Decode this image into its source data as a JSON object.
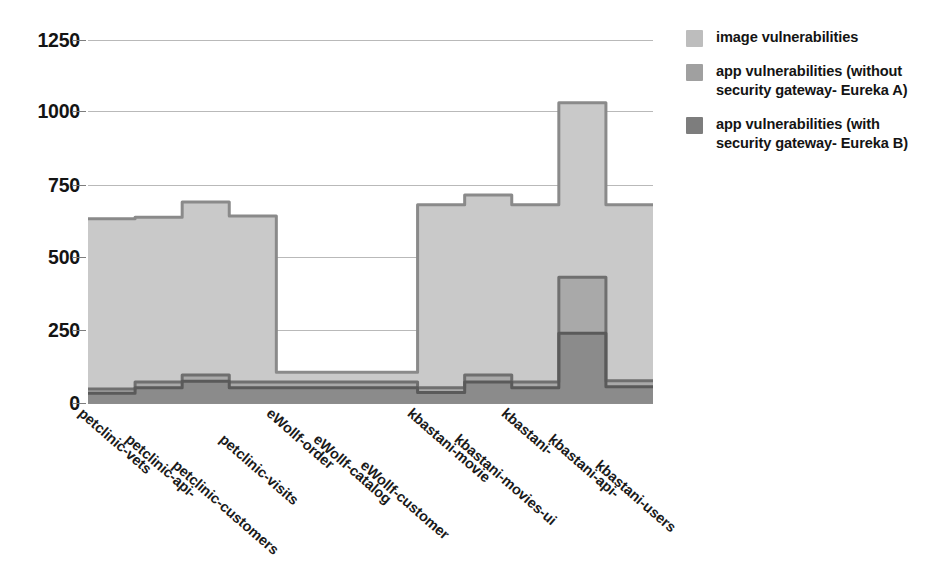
{
  "chart_data": {
    "type": "area",
    "title": "",
    "xlabel": "",
    "ylabel": "",
    "ylim": [
      0,
      1300
    ],
    "yticks": [
      0,
      250,
      500,
      750,
      1000,
      1250
    ],
    "ytick_labels": [
      "0",
      "250",
      "500",
      "750",
      "1000",
      "1250"
    ],
    "grid": true,
    "legend_position": "right",
    "step_style": "mid",
    "categories": [
      "petclinic-vets",
      "petclinic-api-",
      "petclinic-customers",
      "petclinic-visits",
      "eWollf-order",
      "eWollf-catalog",
      "eWollf-customer",
      "kbastani-movie",
      "kbastani-movies-ui",
      "kbastani-",
      "kbastani-api-",
      "kbastani-users"
    ],
    "series": [
      {
        "name": "image vulnerabilities",
        "color": "#c9c9c9",
        "edge_color": "#8a8a8a",
        "values": [
          660,
          665,
          720,
          670,
          110,
          110,
          110,
          710,
          745,
          710,
          1075,
          710
        ]
      },
      {
        "name": "app vulnerabilities (without security gateway- Eureka A)",
        "color": "#a9a9a9",
        "edge_color": "#6f6f6f",
        "values": [
          50,
          75,
          100,
          75,
          75,
          75,
          75,
          55,
          100,
          75,
          450,
          80
        ]
      },
      {
        "name": "app vulnerabilities (with security gateway- Eureka B)",
        "color": "#8b8b8b",
        "edge_color": "#5a5a5a",
        "values": [
          35,
          55,
          78,
          55,
          55,
          55,
          55,
          38,
          75,
          55,
          250,
          58
        ]
      }
    ]
  },
  "legend": {
    "items": [
      {
        "label": "image vulnerabilities",
        "color": "#bdbdbd"
      },
      {
        "label": "app vulnerabilities (without security gateway- Eureka A)",
        "color": "#a0a0a0"
      },
      {
        "label": "app vulnerabilities (with security gateway- Eureka B)",
        "color": "#7d7d7d"
      }
    ]
  },
  "axes": {
    "y_tick_labels": [
      "1250",
      "1000",
      "750",
      "500",
      "250",
      "0"
    ],
    "x_tick_labels": [
      "petclinic-vets",
      "petclinic-api-",
      "petclinic-customers",
      "petclinic-visits",
      "eWollf-order",
      "eWollf-catalog",
      "eWollf-customer",
      "kbastani-movie",
      "kbastani-movies-ui",
      "kbastani-",
      "kbastani-api-",
      "kbastani-users"
    ]
  }
}
